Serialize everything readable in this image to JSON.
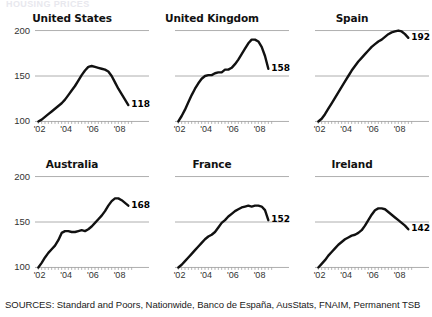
{
  "kicker": "HOUSING PRICES",
  "sources_line": "SOURCES: Standard and Poors, Nationwide, Banco de España, AusStats, FNAIM, Permanent TSB",
  "axis": {
    "y_ticks": [
      "200",
      "150",
      "100"
    ],
    "y_values": [
      200,
      150,
      100
    ],
    "x_ticks": [
      "'02",
      "'04",
      "'06",
      "'08"
    ],
    "x_values": [
      2002,
      2004,
      2006,
      2008
    ],
    "ylim": [
      95,
      205
    ],
    "xlim": [
      2001.5,
      2009.0
    ],
    "gridlines": [
      150,
      200
    ],
    "baseline": 100
  },
  "colors": {
    "line": "#111111",
    "grid": "#9a9a9a",
    "axis_text": "#333333",
    "title": "#111111"
  },
  "chart_data": [
    {
      "type": "line",
      "title": "United States",
      "xlabel": "",
      "ylabel": "",
      "ylim": [
        95,
        205
      ],
      "xlim": [
        2001.5,
        2009.0
      ],
      "grid": true,
      "end_label": "118",
      "x": [
        2001.75,
        2002.0,
        2002.25,
        2002.5,
        2002.75,
        2003.0,
        2003.25,
        2003.5,
        2003.75,
        2004.0,
        2004.25,
        2004.5,
        2004.75,
        2005.0,
        2005.25,
        2005.5,
        2005.75,
        2006.0,
        2006.25,
        2006.5,
        2006.75,
        2007.0,
        2007.25,
        2007.5,
        2007.75,
        2008.0,
        2008.25,
        2008.5
      ],
      "values": [
        100,
        102,
        105,
        108,
        111,
        114,
        117,
        120,
        124,
        129,
        134,
        139,
        145,
        151,
        156,
        160,
        161,
        160,
        159,
        158,
        157,
        155,
        150,
        143,
        136,
        130,
        124,
        118
      ]
    },
    {
      "type": "line",
      "title": "United Kingdom",
      "xlabel": "",
      "ylabel": "",
      "ylim": [
        95,
        205
      ],
      "xlim": [
        2001.5,
        2009.0
      ],
      "grid": true,
      "end_label": "158",
      "x": [
        2001.75,
        2002.0,
        2002.25,
        2002.5,
        2002.75,
        2003.0,
        2003.25,
        2003.5,
        2003.75,
        2004.0,
        2004.25,
        2004.5,
        2004.75,
        2005.0,
        2005.25,
        2005.5,
        2005.75,
        2006.0,
        2006.25,
        2006.5,
        2006.75,
        2007.0,
        2007.25,
        2007.5,
        2007.75,
        2008.0,
        2008.25,
        2008.5
      ],
      "values": [
        100,
        106,
        113,
        121,
        129,
        136,
        142,
        147,
        150,
        151,
        151,
        153,
        154,
        154,
        157,
        157,
        159,
        163,
        168,
        174,
        180,
        186,
        190,
        190,
        188,
        182,
        172,
        158
      ]
    },
    {
      "type": "line",
      "title": "Spain",
      "xlabel": "",
      "ylabel": "",
      "ylim": [
        95,
        205
      ],
      "xlim": [
        2001.5,
        2009.0
      ],
      "grid": true,
      "end_label": "192",
      "x": [
        2001.75,
        2002.0,
        2002.25,
        2002.5,
        2002.75,
        2003.0,
        2003.25,
        2003.5,
        2003.75,
        2004.0,
        2004.25,
        2004.5,
        2004.75,
        2005.0,
        2005.25,
        2005.5,
        2005.75,
        2006.0,
        2006.25,
        2006.5,
        2006.75,
        2007.0,
        2007.25,
        2007.5,
        2007.75,
        2008.0,
        2008.25,
        2008.5
      ],
      "values": [
        100,
        103,
        108,
        114,
        120,
        126,
        132,
        138,
        144,
        150,
        156,
        161,
        166,
        170,
        174,
        178,
        182,
        185,
        188,
        190,
        193,
        196,
        198,
        199,
        200,
        199,
        196,
        192
      ]
    },
    {
      "type": "line",
      "title": "Australia",
      "xlabel": "",
      "ylabel": "",
      "ylim": [
        95,
        205
      ],
      "xlim": [
        2001.5,
        2009.0
      ],
      "grid": true,
      "end_label": "168",
      "x": [
        2001.75,
        2002.0,
        2002.25,
        2002.5,
        2002.75,
        2003.0,
        2003.25,
        2003.5,
        2003.75,
        2004.0,
        2004.25,
        2004.5,
        2004.75,
        2005.0,
        2005.25,
        2005.5,
        2005.75,
        2006.0,
        2006.25,
        2006.5,
        2006.75,
        2007.0,
        2007.25,
        2007.5,
        2007.75,
        2008.0,
        2008.25,
        2008.5
      ],
      "values": [
        100,
        105,
        111,
        116,
        120,
        124,
        130,
        138,
        140,
        140,
        139,
        139,
        140,
        141,
        140,
        142,
        145,
        149,
        153,
        157,
        162,
        168,
        173,
        176,
        176,
        174,
        171,
        168
      ]
    },
    {
      "type": "line",
      "title": "France",
      "xlabel": "",
      "ylabel": "",
      "ylim": [
        95,
        205
      ],
      "xlim": [
        2001.5,
        2009.0
      ],
      "grid": true,
      "end_label": "152",
      "x": [
        2001.75,
        2002.0,
        2002.25,
        2002.5,
        2002.75,
        2003.0,
        2003.25,
        2003.5,
        2003.75,
        2004.0,
        2004.25,
        2004.5,
        2004.75,
        2005.0,
        2005.25,
        2005.5,
        2005.75,
        2006.0,
        2006.25,
        2006.5,
        2006.75,
        2007.0,
        2007.25,
        2007.5,
        2007.75,
        2008.0,
        2008.25,
        2008.5
      ],
      "values": [
        100,
        103,
        107,
        111,
        115,
        119,
        123,
        127,
        131,
        134,
        136,
        139,
        144,
        149,
        152,
        156,
        159,
        162,
        164,
        166,
        167,
        168,
        167,
        168,
        168,
        167,
        163,
        152
      ]
    },
    {
      "type": "line",
      "title": "Ireland",
      "xlabel": "",
      "ylabel": "",
      "ylim": [
        95,
        205
      ],
      "xlim": [
        2001.5,
        2009.0
      ],
      "grid": true,
      "end_label": "142",
      "x": [
        2001.75,
        2002.0,
        2002.25,
        2002.5,
        2002.75,
        2003.0,
        2003.25,
        2003.5,
        2003.75,
        2004.0,
        2004.25,
        2004.5,
        2004.75,
        2005.0,
        2005.25,
        2005.5,
        2005.75,
        2006.0,
        2006.25,
        2006.5,
        2006.75,
        2007.0,
        2007.25,
        2007.5,
        2007.75,
        2008.0,
        2008.25,
        2008.5
      ],
      "values": [
        100,
        104,
        108,
        113,
        117,
        121,
        125,
        128,
        131,
        133,
        135,
        136,
        138,
        141,
        146,
        152,
        158,
        163,
        165,
        165,
        164,
        161,
        158,
        155,
        152,
        149,
        146,
        142
      ]
    }
  ]
}
